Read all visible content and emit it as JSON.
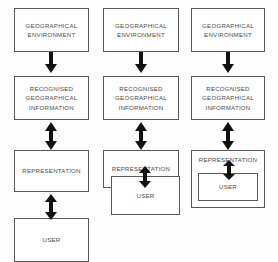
{
  "diagram": {
    "colors": {
      "box_border": "#585858",
      "box_fill": "#ffffff",
      "arrow_fill": "#111111",
      "text": "#4a4a4a",
      "background": "#fdfdfd"
    },
    "labels": {
      "geographical_environment": [
        "GEOGRAPHICAL",
        "ENVIRONMENT"
      ],
      "recognised_geographical_information": [
        "RECOGNISED",
        "GEOGRAPHICAL",
        "INFORMATION"
      ],
      "representation": [
        "REPRESENTATION"
      ],
      "user": [
        "USER"
      ]
    },
    "columns": [
      {
        "index": 1,
        "nodes": [
          {
            "name": "geographical-environment",
            "text_lines": [
              "GEOGRAPHICAL",
              "ENVIRONMENT"
            ]
          },
          {
            "name": "recognised-geographical-information",
            "text_lines": [
              "RECOGNISED",
              "GEOGRAPHICAL",
              "INFORMATION"
            ]
          },
          {
            "name": "representation",
            "text_lines": [
              "REPRESENTATION"
            ]
          },
          {
            "name": "user",
            "text_lines": [
              "USER"
            ]
          }
        ],
        "connectors": [
          {
            "from": "geographical-environment",
            "to": "recognised-geographical-information",
            "type": "single-down"
          },
          {
            "from": "recognised-geographical-information",
            "to": "representation",
            "type": "double"
          },
          {
            "from": "representation",
            "to": "user",
            "type": "double"
          }
        ],
        "nesting": "separate"
      },
      {
        "index": 2,
        "nodes": [
          {
            "name": "geographical-environment",
            "text_lines": [
              "GEOGRAPHICAL",
              "ENVIRONMENT"
            ]
          },
          {
            "name": "recognised-geographical-information",
            "text_lines": [
              "RECOGNISED",
              "GEOGRAPHICAL",
              "INFORMATION"
            ]
          },
          {
            "name": "representation",
            "text_lines": [
              "REPRESENTATION"
            ]
          },
          {
            "name": "user",
            "text_lines": [
              "USER"
            ]
          }
        ],
        "connectors": [
          {
            "from": "geographical-environment",
            "to": "recognised-geographical-information",
            "type": "single-down"
          },
          {
            "from": "recognised-geographical-information",
            "to": "representation",
            "type": "double"
          },
          {
            "from": "representation",
            "to": "user",
            "type": "double"
          }
        ],
        "nesting": "overlapping"
      },
      {
        "index": 3,
        "nodes": [
          {
            "name": "geographical-environment",
            "text_lines": [
              "GEOGRAPHICAL",
              "ENVIRONMENT"
            ]
          },
          {
            "name": "recognised-geographical-information",
            "text_lines": [
              "RECOGNISED",
              "GEOGRAPHICAL",
              "INFORMATION"
            ]
          },
          {
            "name": "representation",
            "text_lines": [
              "REPRESENTATION"
            ]
          },
          {
            "name": "user",
            "text_lines": [
              "USER"
            ]
          }
        ],
        "connectors": [
          {
            "from": "geographical-environment",
            "to": "recognised-geographical-information",
            "type": "single-down"
          },
          {
            "from": "recognised-geographical-information",
            "to": "representation",
            "type": "double"
          },
          {
            "from": "representation",
            "to": "user",
            "type": "double"
          }
        ],
        "nesting": "nested"
      }
    ]
  }
}
